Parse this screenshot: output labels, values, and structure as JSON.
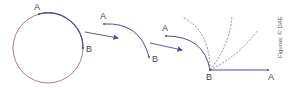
{
  "figure": {
    "stages": [
      {
        "id": "circle",
        "point_a": "A",
        "point_b": "B"
      },
      {
        "id": "cut-arc",
        "point_a": "A",
        "point_b": "B"
      },
      {
        "id": "straightening-arc",
        "point_a": "A",
        "point_b": "B"
      },
      {
        "id": "straight-segment",
        "point_a": "A",
        "point_b": "B"
      }
    ],
    "credit": "Figuras: © DAE",
    "colors": {
      "circle": "#b47a7a",
      "arc": "#4a4a9a",
      "arrow": "#4a4aa0",
      "dashed": "#6a6ab0",
      "text": "#444444"
    }
  }
}
